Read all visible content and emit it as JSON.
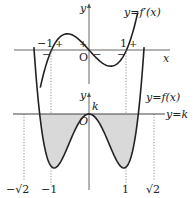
{
  "top_graph": {
    "curve_label": "y=f′(x)",
    "y_axis_label": "y",
    "x_axis_label": "x",
    "origin_label": "O",
    "tick_labels": [
      "−1",
      "1"
    ],
    "sign_marks": [
      {
        "text": "−",
        "near": "left of -1, below"
      },
      {
        "text": "+",
        "near": "right of -1, above"
      },
      {
        "text": "+",
        "near": "left of 0, above"
      },
      {
        "text": "−",
        "near": "right of 0, below"
      },
      {
        "text": "−",
        "near": "left of 1, below"
      },
      {
        "text": "+",
        "near": "right of 1, above"
      }
    ],
    "roots": [
      -1,
      0,
      1
    ]
  },
  "bottom_graph": {
    "curve_label": "y=f(x)",
    "line_label": "y=k",
    "y_axis_label": "y",
    "origin_label": "O",
    "k_label": "k",
    "tick_labels": [
      "−√2",
      "−1",
      "1",
      "√2"
    ],
    "minima_x": [
      -1,
      1
    ],
    "local_max_x": 0,
    "intersections_with_k": [
      "−√2",
      "0",
      "√2"
    ],
    "shaded": "region between y=k and y=f(x) for −√2 ≤ x ≤ √2"
  },
  "colors": {
    "curve": "#222222",
    "axis": "#555555",
    "shade": "#d9d9d9",
    "dotted": "#777777"
  }
}
